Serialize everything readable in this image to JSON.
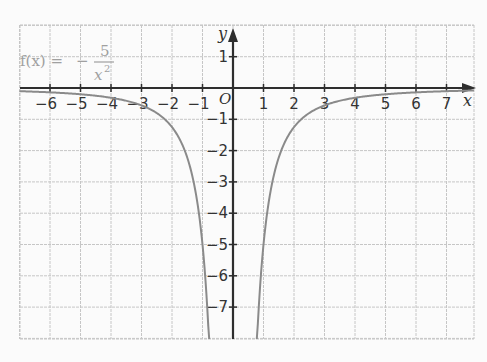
{
  "chart_data": {
    "type": "line",
    "title": "",
    "function_label": {
      "lhs": "f(x) =",
      "minus": "−",
      "numerator": "5",
      "denominator": "x",
      "exponent": "2"
    },
    "expression": "f(x) = -5/x^2",
    "xlabel": "x",
    "ylabel": "y",
    "origin_label": "O",
    "xlim": [
      -7,
      7.9
    ],
    "ylim": [
      -8.1,
      2
    ],
    "grid": true,
    "x_ticks": [
      -6,
      -5,
      -4,
      -3,
      -2,
      -1,
      1,
      2,
      3,
      4,
      5,
      6,
      7
    ],
    "x_tick_labels": [
      "−6",
      "−5",
      "−4",
      "−3",
      "−2",
      "−1",
      "1",
      "2",
      "3",
      "4",
      "5",
      "6",
      "7"
    ],
    "y_ticks": [
      1,
      -1,
      -2,
      -3,
      -4,
      -5,
      -6,
      -7
    ],
    "y_tick_labels": [
      "1",
      "−1",
      "−2",
      "−3",
      "−4",
      "−5",
      "−6",
      "−7"
    ],
    "series": [
      {
        "name": "f(x) = -5/x^2",
        "branch": "left",
        "x": [
          -7,
          -6,
          -5,
          -4,
          -3,
          -2,
          -1.5,
          -1,
          -0.9,
          -0.8,
          -0.78
        ],
        "y": [
          -0.1,
          -0.14,
          -0.2,
          -0.31,
          -0.56,
          -1.25,
          -2.22,
          -5,
          -6.17,
          -7.81,
          -8.2
        ]
      },
      {
        "name": "f(x) = -5/x^2",
        "branch": "right",
        "x": [
          0.78,
          0.8,
          0.9,
          1,
          1.5,
          2,
          3,
          4,
          5,
          6,
          7,
          7.9
        ],
        "y": [
          -8.2,
          -7.81,
          -6.17,
          -5,
          -2.22,
          -1.25,
          -0.56,
          -0.31,
          -0.2,
          -0.14,
          -0.1,
          -0.08
        ]
      }
    ],
    "colors": {
      "axis": "#2e2e2e",
      "grid": "#c6c6c6",
      "curve": "#8a8a8a",
      "label": "#a0a0a0",
      "background": "#fbfbfb"
    }
  }
}
